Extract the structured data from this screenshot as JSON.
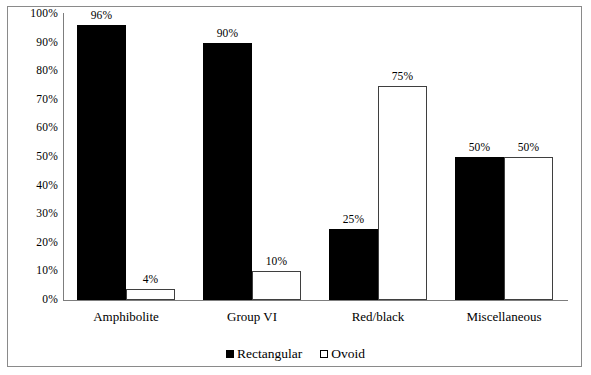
{
  "chart_data": {
    "type": "bar",
    "title": "",
    "subtitle": "",
    "xlabel": "",
    "ylabel": "",
    "ylim": [
      0,
      100
    ],
    "grid": false,
    "legend_position": "bottom",
    "categories": [
      "Amphibolite",
      "Group VI",
      "Red/black",
      "Miscellaneous"
    ],
    "y_ticks": [
      "0%",
      "10%",
      "20%",
      "30%",
      "40%",
      "50%",
      "60%",
      "70%",
      "80%",
      "90%",
      "100%"
    ],
    "y_tick_values": [
      0,
      10,
      20,
      30,
      40,
      50,
      60,
      70,
      80,
      90,
      100
    ],
    "series": [
      {
        "name": "Rectangular",
        "color": "#000000",
        "style": "filled",
        "values": [
          96,
          90,
          25,
          50
        ],
        "labels": [
          "96%",
          "90%",
          "25%",
          "50%"
        ]
      },
      {
        "name": "Ovoid",
        "color": "#ffffff",
        "style": "outlined",
        "values": [
          4,
          10,
          75,
          50
        ],
        "labels": [
          "4%",
          "10%",
          "75%",
          "50%"
        ]
      }
    ]
  },
  "legend": {
    "items": [
      {
        "label": "Rectangular",
        "swatch": "filled-square-icon"
      },
      {
        "label": "Ovoid",
        "swatch": "outlined-square-icon"
      }
    ]
  }
}
